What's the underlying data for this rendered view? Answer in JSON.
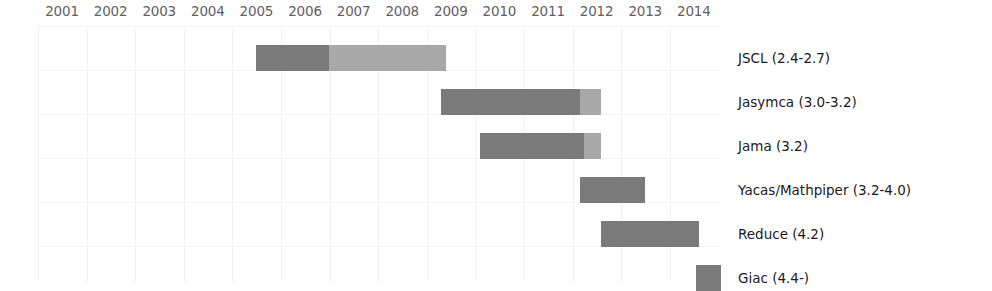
{
  "chart_data": {
    "type": "bar",
    "subtype": "gantt-timeline",
    "title": "",
    "xlabel": "",
    "ylabel": "",
    "xlim": [
      2001,
      2014.5
    ],
    "grid": true,
    "legend_position": "right-inline",
    "axis_position": "top",
    "tick_labels": [
      "2001",
      "2002",
      "2003",
      "2004",
      "2005",
      "2006",
      "2007",
      "2008",
      "2009",
      "2010",
      "2011",
      "2012",
      "2013",
      "2014"
    ],
    "colors": {
      "primary_segment": "#7a7a7a",
      "secondary_segment": "#a8a8a8",
      "gridline": "#f2f2f2",
      "tick_text": "#5f5f5f",
      "label_text": "#1a1a1a",
      "background": "#ffffff"
    },
    "categories": [
      "JSCL (2.4-2.7)",
      "Jasymca (3.0-3.2)",
      "Jama (3.2)",
      "Yacas/Mathpiper (3.2-4.0)",
      "Reduce (4.2)",
      "Giac (4.4-)"
    ],
    "rows": [
      {
        "label": "JSCL (2.4-2.7)",
        "start": 2005.0,
        "end": 2008.9,
        "segments": [
          {
            "start": 2005.0,
            "end": 2006.5,
            "color": "#7a7a7a"
          },
          {
            "start": 2006.5,
            "end": 2008.9,
            "color": "#a8a8a8"
          }
        ]
      },
      {
        "label": "Jasymca (3.0-3.2)",
        "start": 2008.8,
        "end": 2012.1,
        "segments": [
          {
            "start": 2008.8,
            "end": 2011.65,
            "color": "#7a7a7a"
          },
          {
            "start": 2011.65,
            "end": 2012.1,
            "color": "#a8a8a8"
          }
        ]
      },
      {
        "label": "Jama (3.2)",
        "start": 2009.6,
        "end": 2012.1,
        "segments": [
          {
            "start": 2009.6,
            "end": 2011.75,
            "color": "#7a7a7a"
          },
          {
            "start": 2011.75,
            "end": 2012.1,
            "color": "#a8a8a8"
          }
        ]
      },
      {
        "label": "Yacas/Mathpiper (3.2-4.0)",
        "start": 2011.65,
        "end": 2013.0,
        "segments": [
          {
            "start": 2011.65,
            "end": 2013.0,
            "color": "#7a7a7a"
          }
        ]
      },
      {
        "label": "Reduce (4.2)",
        "start": 2012.1,
        "end": 2014.1,
        "segments": [
          {
            "start": 2012.1,
            "end": 2014.1,
            "color": "#7a7a7a"
          }
        ]
      },
      {
        "label": "Giac (4.4-)",
        "start": 2014.05,
        "end": 2014.55,
        "segments": [
          {
            "start": 2014.05,
            "end": 2014.55,
            "color": "#7a7a7a"
          }
        ]
      }
    ]
  }
}
